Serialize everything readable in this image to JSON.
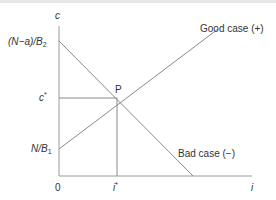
{
  "diagram": {
    "axes": {
      "y_label": "c",
      "x_label": "i",
      "origin_label": "0"
    },
    "y_ticks": {
      "top": {
        "num": "(N−a)/B",
        "sub": "2"
      },
      "mid": {
        "base": "c",
        "sup": "*"
      },
      "low": {
        "num": "N/B",
        "sub": "1"
      }
    },
    "x_ticks": {
      "mid": {
        "base": "i",
        "sup": "*"
      }
    },
    "lines": [
      {
        "name": "Good case (+)",
        "from": [
          59,
          149
        ],
        "to": [
          218,
          29
        ],
        "color": "#8a8a8a"
      },
      {
        "name": "Bad case (−)",
        "from": [
          59,
          41
        ],
        "to": [
          193,
          176
        ],
        "color": "#8a8a8a"
      }
    ],
    "intersection": {
      "label": "P",
      "x": 117,
      "y": 98
    },
    "labels": {
      "good_case": "Good case (+)",
      "bad_case": "Bad case (−)"
    },
    "colors": {
      "axis": "#9a9a9a",
      "line": "#8a8a8a",
      "text": "#333333"
    }
  }
}
